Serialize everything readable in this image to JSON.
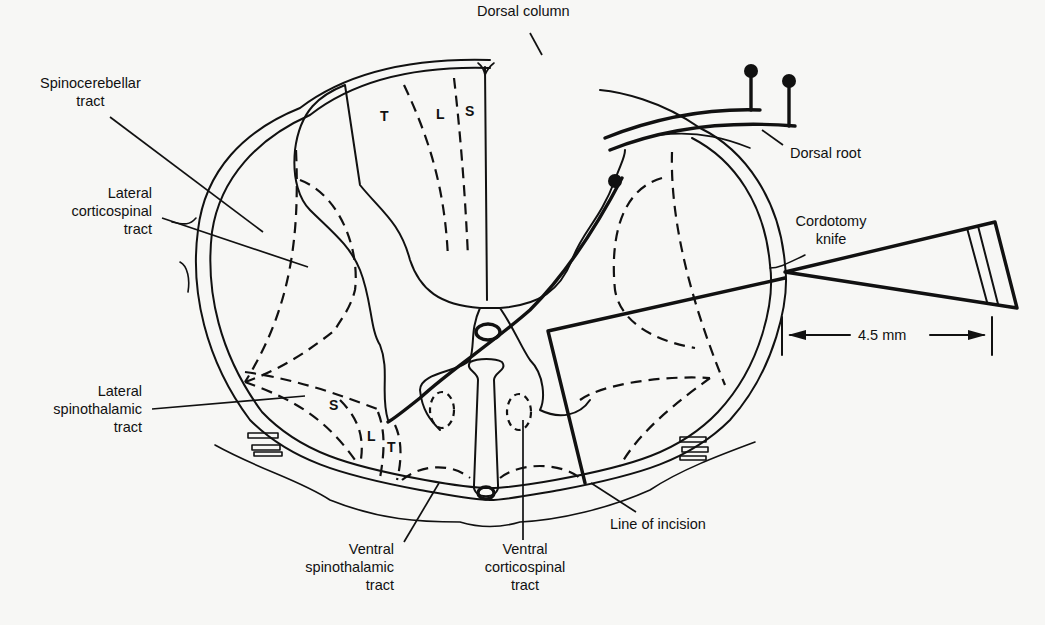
{
  "figure": {
    "labels": {
      "dorsal_column": "Dorsal column",
      "spinocerebellar": "Spinocerebellar\ntract",
      "lateral_corticospinal": "Lateral\ncorticospinal\ntract",
      "lateral_spinothalamic": "Lateral\nspinothalamic\ntract",
      "ventral_spinothalamic": "Ventral\nspinothalamic\ntract",
      "ventral_corticospinal": "Ventral\ncorticospinal\ntract",
      "line_of_incision": "Line of incision",
      "dorsal_root": "Dorsal root",
      "cordotomy_knife": "Cordotomy\nknife",
      "measurement": "4.5 mm"
    },
    "somatotopy": {
      "dorsal": [
        "T",
        "L",
        "S"
      ],
      "lateral_spinothalamic": [
        "S",
        "L",
        "T"
      ]
    },
    "colors": {
      "ink": "#111111",
      "paper": "#f7f7f5"
    }
  }
}
